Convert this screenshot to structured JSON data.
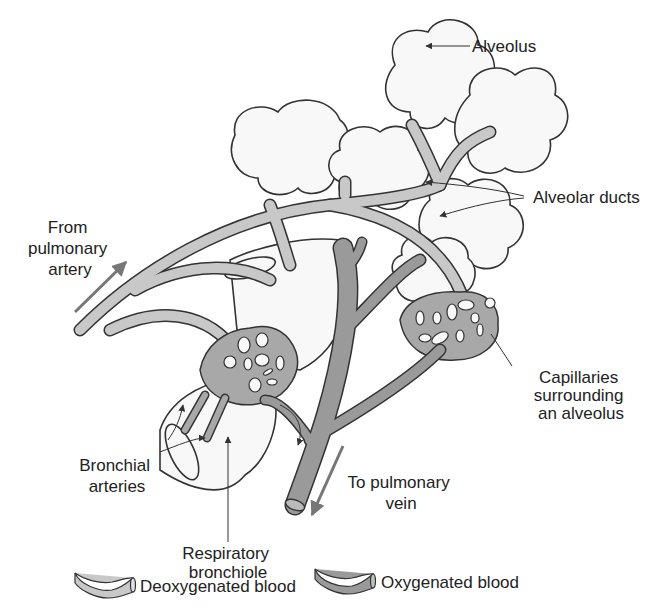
{
  "diagram": {
    "labels": {
      "alveolus": "Alveolus",
      "alveolar_ducts": "Alveolar ducts",
      "from_pulmonary_artery": [
        "From",
        "pulmonary",
        "artery"
      ],
      "capillaries": [
        "Capillaries",
        "surrounding",
        "an alveolus"
      ],
      "to_pulmonary_vein": [
        "To pulmonary",
        "vein"
      ],
      "bronchial_arteries": [
        "Bronchial",
        "arteries"
      ],
      "respiratory_bronchiole": [
        "Respiratory",
        "bronchiole"
      ]
    },
    "legend": [
      {
        "label": "Deoxygenated blood",
        "color": "#c8c8c8"
      },
      {
        "label": "Oxygenated blood",
        "color": "#9a9a9a"
      }
    ],
    "colors": {
      "deoxygenated": "#c8c8c8",
      "oxygenated": "#9a9a9a",
      "alveolus_fill": "#f8f8f8",
      "outline": "#333333",
      "arrow": "#777777"
    }
  }
}
